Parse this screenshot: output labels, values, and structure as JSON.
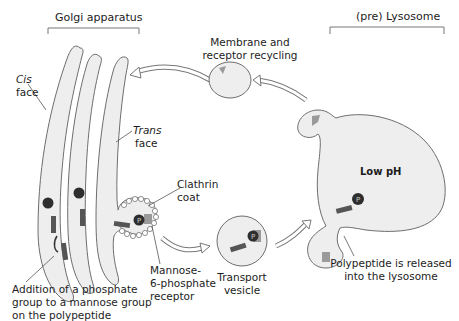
{
  "diagram": {
    "title_left": "Golgi apparatus",
    "title_right": "(pre) Lysosome",
    "labels": {
      "cis_face_1": "Cis",
      "cis_face_2": "face",
      "trans_face_1": "Trans",
      "trans_face_2": "face",
      "membrane_recycling_1": "Membrane and",
      "membrane_recycling_2": "receptor recycling",
      "clathrin_1": "Clathrin",
      "clathrin_2": "coat",
      "m6p_1": "Mannose-",
      "m6p_2": "6-phosphate",
      "m6p_3": "receptor",
      "transport_1": "Transport",
      "transport_2": "vesicle",
      "low_ph": "Low pH",
      "released_1": "Polypeptide is released",
      "released_2": "into the lysosome",
      "addition_1": "Addition of a phosphate",
      "addition_2": "group to a mannose group",
      "addition_3": "on the polypeptide"
    },
    "phosphate_symbol": "P",
    "colors": {
      "fill": "#eeeeee",
      "stroke": "#6e6e6e",
      "receptor": "#9a9a9a",
      "peptide": "#555555",
      "phosphate": "#2e2e2e"
    }
  }
}
